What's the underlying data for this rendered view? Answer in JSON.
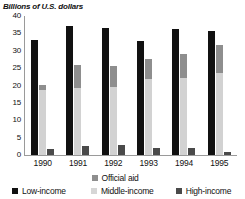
{
  "chart_data": {
    "type": "bar",
    "title": "",
    "ylabel": "Billions of U.S. dollars",
    "xlabel": "",
    "ylim": [
      0,
      40
    ],
    "yticks": [
      40,
      35,
      30,
      25,
      20,
      15,
      10,
      5,
      0
    ],
    "grid": false,
    "legend_position": "bottom",
    "categories": [
      "1990",
      "1991",
      "1992",
      "1993",
      "1994",
      "1995"
    ],
    "series": [
      {
        "name": "Low-income",
        "color": "#111111",
        "values": [
          33.2,
          37.0,
          36.5,
          32.9,
          36.2,
          35.6
        ]
      },
      {
        "name": "Middle-income",
        "color": "#d2d2d2",
        "values": [
          18.6,
          19.4,
          19.6,
          22.0,
          22.1,
          23.5
        ]
      },
      {
        "name": "Official aid",
        "color": "#8e8e8e",
        "values": [
          1.6,
          6.5,
          6.0,
          5.6,
          6.9,
          8.1
        ],
        "stacked_on": "Middle-income",
        "totals": [
          20.2,
          25.9,
          25.6,
          27.6,
          29.0,
          31.6
        ]
      },
      {
        "name": "High-income",
        "color": "#4a4a4a",
        "values": [
          1.8,
          2.6,
          3.0,
          1.9,
          2.0,
          1.0
        ]
      }
    ]
  },
  "legend": {
    "official_aid": "Official aid",
    "low_income": "Low-income",
    "middle_income": "Middle-income",
    "high_income": "High-income"
  }
}
